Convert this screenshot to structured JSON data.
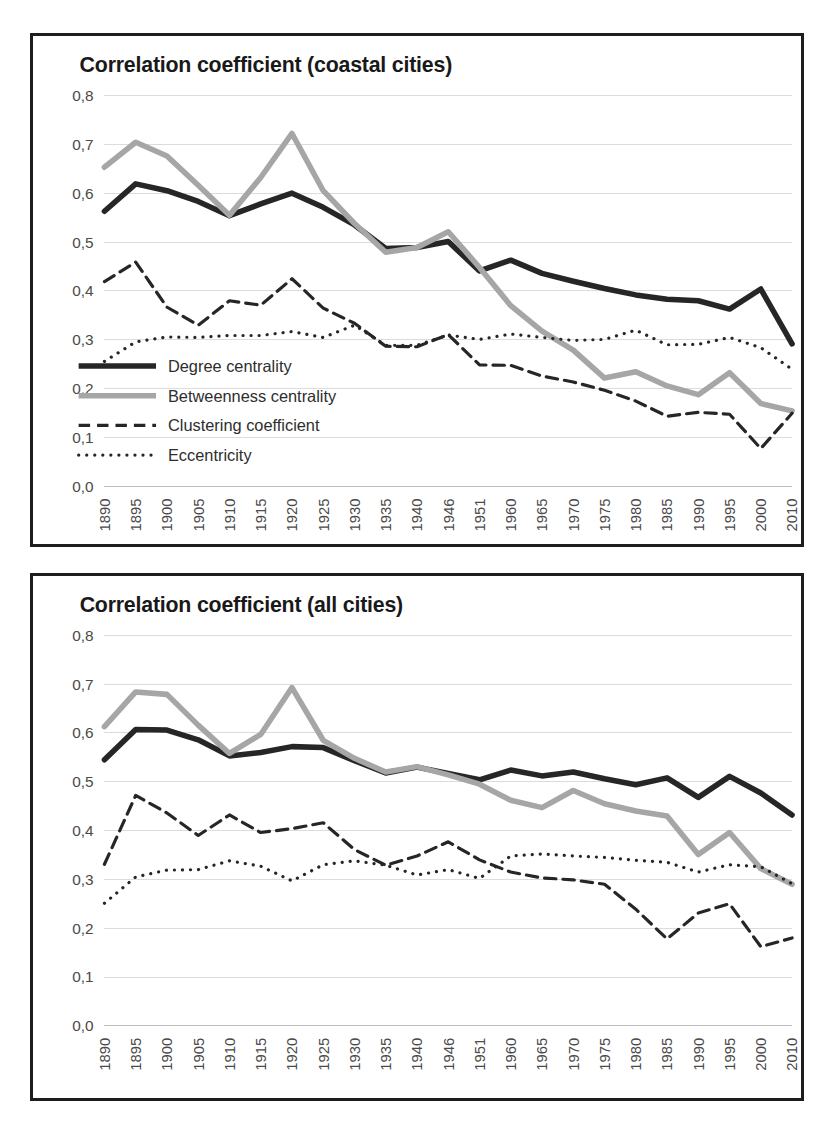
{
  "figure": {
    "background_color": "#ffffff",
    "frame_color": "#1d1d1d"
  },
  "charts": [
    {
      "id": "coastal",
      "title": "Correlation coefficient (coastal cities)"
    },
    {
      "id": "all",
      "title": "Correlation coefficient (all cities)"
    }
  ],
  "legend": {
    "position": "inside-lower-left",
    "items": [
      {
        "label": "Degree centrality",
        "style": "solid",
        "color": "#262626",
        "width": 5.5
      },
      {
        "label": "Betweenness centrality",
        "style": "solid",
        "color": "#a6a6a6",
        "width": 5.5
      },
      {
        "label": "Clustering coefficient",
        "style": "dashed",
        "color": "#262626",
        "width": 3
      },
      {
        "label": "Eccentricity",
        "style": "dotted",
        "color": "#262626",
        "width": 3
      }
    ]
  },
  "chart_data": [
    {
      "type": "line",
      "title": "Correlation coefficient (coastal cities)",
      "xlabel": "",
      "ylabel": "",
      "ylim": [
        0.0,
        0.8
      ],
      "yticks": [
        "0,0",
        "0,1",
        "0,2",
        "0,3",
        "0,4",
        "0,5",
        "0,6",
        "0,7",
        "0,8"
      ],
      "ytick_values": [
        0.0,
        0.1,
        0.2,
        0.3,
        0.4,
        0.5,
        0.6,
        0.7,
        0.8
      ],
      "grid": true,
      "legend": [
        "Degree centrality",
        "Betweenness centrality",
        "Clustering coefficient",
        "Eccentricity"
      ],
      "categories": [
        "1890",
        "1895",
        "1900",
        "1905",
        "1910",
        "1915",
        "1920",
        "1925",
        "1930",
        "1935",
        "1940",
        "1946",
        "1951",
        "1960",
        "1965",
        "1970",
        "1975",
        "1980",
        "1985",
        "1990",
        "1995",
        "2000",
        "2010"
      ],
      "series": [
        {
          "name": "Degree centrality",
          "style": "solid",
          "color": "#262626",
          "values": [
            0.563,
            0.619,
            0.605,
            0.583,
            0.554,
            0.578,
            0.6,
            0.571,
            0.535,
            0.487,
            0.489,
            0.501,
            0.441,
            0.463,
            0.436,
            0.42,
            0.405,
            0.392,
            0.383,
            0.38,
            0.363,
            0.404,
            0.292
          ]
        },
        {
          "name": "Betweenness centrality",
          "style": "solid",
          "color": "#a6a6a6",
          "values": [
            0.653,
            0.704,
            0.676,
            0.616,
            0.555,
            0.632,
            0.722,
            0.605,
            0.538,
            0.479,
            0.489,
            0.521,
            0.448,
            0.37,
            0.318,
            0.279,
            0.222,
            0.235,
            0.206,
            0.188,
            0.233,
            0.17,
            0.155
          ]
        },
        {
          "name": "Clustering coefficient",
          "style": "dashed",
          "color": "#262626",
          "values": [
            0.419,
            0.459,
            0.367,
            0.33,
            0.38,
            0.371,
            0.425,
            0.365,
            0.334,
            0.287,
            0.286,
            0.311,
            0.249,
            0.248,
            0.226,
            0.214,
            0.197,
            0.175,
            0.144,
            0.152,
            0.148,
            0.078,
            0.15
          ]
        },
        {
          "name": "Eccentricity",
          "style": "dotted",
          "color": "#262626",
          "values": [
            0.256,
            0.296,
            0.306,
            0.305,
            0.309,
            0.309,
            0.317,
            0.305,
            0.33,
            0.289,
            0.289,
            0.31,
            0.301,
            0.312,
            0.305,
            0.299,
            0.301,
            0.32,
            0.29,
            0.291,
            0.305,
            0.284,
            0.24
          ]
        }
      ]
    },
    {
      "type": "line",
      "title": "Correlation coefficient (all cities)",
      "xlabel": "",
      "ylabel": "",
      "ylim": [
        0.0,
        0.8
      ],
      "yticks": [
        "0,0",
        "0,1",
        "0,2",
        "0,3",
        "0,4",
        "0,5",
        "0,6",
        "0,7",
        "0,8"
      ],
      "ytick_values": [
        0.0,
        0.1,
        0.2,
        0.3,
        0.4,
        0.5,
        0.6,
        0.7,
        0.8
      ],
      "grid": true,
      "legend": [],
      "categories": [
        "1890",
        "1895",
        "1900",
        "1905",
        "1910",
        "1915",
        "1920",
        "1925",
        "1930",
        "1935",
        "1940",
        "1946",
        "1951",
        "1960",
        "1965",
        "1970",
        "1975",
        "1980",
        "1985",
        "1990",
        "1995",
        "2000",
        "2010"
      ],
      "series": [
        {
          "name": "Degree centrality",
          "style": "solid",
          "color": "#262626",
          "values": [
            0.545,
            0.607,
            0.606,
            0.586,
            0.553,
            0.56,
            0.572,
            0.57,
            0.543,
            0.518,
            0.53,
            0.517,
            0.504,
            0.524,
            0.512,
            0.52,
            0.506,
            0.494,
            0.508,
            0.468,
            0.511,
            0.477,
            0.432
          ]
        },
        {
          "name": "Betweenness centrality",
          "style": "solid",
          "color": "#a6a6a6",
          "values": [
            0.613,
            0.684,
            0.679,
            0.616,
            0.558,
            0.597,
            0.693,
            0.585,
            0.548,
            0.52,
            0.531,
            0.514,
            0.495,
            0.462,
            0.447,
            0.482,
            0.455,
            0.44,
            0.43,
            0.351,
            0.396,
            0.322,
            0.29
          ]
        },
        {
          "name": "Clustering coefficient",
          "style": "dashed",
          "color": "#262626",
          "values": [
            0.331,
            0.472,
            0.436,
            0.39,
            0.432,
            0.396,
            0.404,
            0.416,
            0.361,
            0.329,
            0.348,
            0.377,
            0.34,
            0.315,
            0.303,
            0.299,
            0.29,
            0.239,
            0.178,
            0.231,
            0.25,
            0.162,
            0.18
          ]
        },
        {
          "name": "Eccentricity",
          "style": "dotted",
          "color": "#262626",
          "values": [
            0.251,
            0.305,
            0.319,
            0.32,
            0.338,
            0.327,
            0.297,
            0.33,
            0.338,
            0.329,
            0.309,
            0.32,
            0.302,
            0.348,
            0.352,
            0.348,
            0.345,
            0.339,
            0.335,
            0.315,
            0.33,
            0.326,
            0.291
          ]
        }
      ]
    }
  ]
}
